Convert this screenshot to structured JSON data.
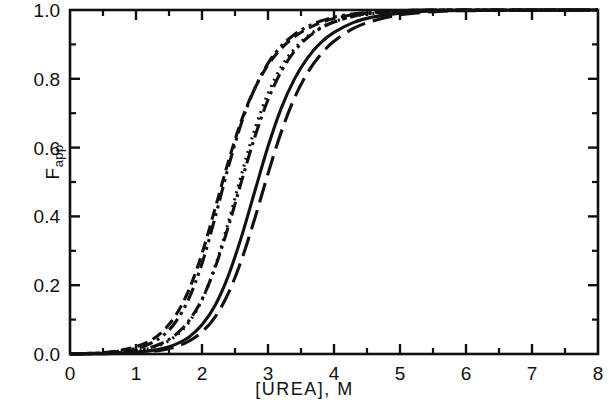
{
  "chart_data": {
    "type": "line",
    "title": "",
    "xlabel": "[UREA], M",
    "ylabel": "Fapp",
    "ylabel_base": "F",
    "ylabel_sub": "app",
    "xlim": [
      0,
      8
    ],
    "ylim": [
      0.0,
      1.0
    ],
    "grid": false,
    "legend": "none",
    "xticks": [
      0,
      1,
      2,
      3,
      4,
      5,
      6,
      7,
      8
    ],
    "xtick_labels": [
      "0",
      "1",
      "2",
      "3",
      "4",
      "5",
      "6",
      "7",
      "8"
    ],
    "xminor_ticks": [
      0.5,
      1.5,
      2.5,
      3.5,
      4.5,
      5.5,
      6.5,
      7.5
    ],
    "yticks": [
      0.0,
      0.2,
      0.4,
      0.6,
      0.8,
      1.0
    ],
    "ytick_labels": [
      "0.0",
      "0.2",
      "0.4",
      "0.6",
      "0.8",
      "1.0"
    ],
    "yminor_ticks": [
      0.1,
      0.3,
      0.5,
      0.7,
      0.9
    ],
    "line_color": "#111111",
    "series": [
      {
        "name": "curve-1",
        "style": "dashed",
        "dasharray": "11,6",
        "midpoint": 1.95,
        "slope": 1.95,
        "x": [
          0.0,
          0.5,
          0.8,
          1.0,
          1.2,
          1.4,
          1.6,
          1.8,
          2.0,
          2.2,
          2.4,
          2.6,
          2.8,
          3.0,
          3.2,
          3.4,
          3.6,
          3.8,
          4.0,
          4.3,
          4.6,
          5.0,
          5.5,
          6.0,
          8.0
        ],
        "y": [
          0.0,
          0.004,
          0.012,
          0.021,
          0.037,
          0.065,
          0.112,
          0.186,
          0.292,
          0.424,
          0.56,
          0.68,
          0.772,
          0.84,
          0.888,
          0.922,
          0.946,
          0.963,
          0.975,
          0.987,
          0.993,
          0.998,
          1.0,
          1.0,
          1.0
        ]
      },
      {
        "name": "curve-2",
        "style": "dash-dot-dot",
        "dasharray": "14,5,3,5,3,5",
        "midpoint": 2.05,
        "slope": 2.1,
        "x": [
          0.0,
          0.5,
          0.8,
          1.0,
          1.2,
          1.4,
          1.6,
          1.8,
          2.0,
          2.2,
          2.4,
          2.6,
          2.8,
          3.0,
          3.2,
          3.4,
          3.6,
          3.8,
          4.0,
          4.3,
          4.6,
          5.0,
          5.5,
          6.0,
          8.0
        ],
        "y": [
          0.0,
          0.003,
          0.009,
          0.016,
          0.029,
          0.052,
          0.093,
          0.161,
          0.263,
          0.398,
          0.544,
          0.673,
          0.772,
          0.845,
          0.895,
          0.929,
          0.952,
          0.968,
          0.979,
          0.989,
          0.994,
          0.998,
          1.0,
          1.0,
          1.0
        ]
      },
      {
        "name": "curve-3",
        "style": "dotted",
        "dasharray": "2,5",
        "midpoint": 2.35,
        "slope": 2.05,
        "x": [
          0.0,
          0.5,
          0.8,
          1.0,
          1.2,
          1.4,
          1.6,
          1.8,
          2.0,
          2.2,
          2.4,
          2.6,
          2.8,
          3.0,
          3.2,
          3.4,
          3.6,
          3.8,
          4.0,
          4.3,
          4.6,
          5.0,
          5.5,
          6.0,
          8.0
        ],
        "y": [
          0.0,
          0.002,
          0.005,
          0.009,
          0.016,
          0.029,
          0.052,
          0.092,
          0.157,
          0.255,
          0.383,
          0.523,
          0.653,
          0.757,
          0.834,
          0.887,
          0.924,
          0.949,
          0.966,
          0.982,
          0.99,
          0.996,
          0.999,
          1.0,
          1.0
        ]
      },
      {
        "name": "curve-4",
        "style": "dash-dot",
        "dasharray": "14,5,3,5",
        "midpoint": 2.45,
        "slope": 1.85,
        "x": [
          0.0,
          0.5,
          0.8,
          1.0,
          1.2,
          1.4,
          1.6,
          1.8,
          2.0,
          2.2,
          2.4,
          2.6,
          2.8,
          3.0,
          3.2,
          3.4,
          3.6,
          3.8,
          4.0,
          4.3,
          4.6,
          5.0,
          5.5,
          6.0,
          8.0
        ],
        "y": [
          0.0,
          0.002,
          0.006,
          0.01,
          0.018,
          0.032,
          0.056,
          0.096,
          0.159,
          0.252,
          0.371,
          0.503,
          0.631,
          0.739,
          0.821,
          0.88,
          0.92,
          0.947,
          0.965,
          0.982,
          0.991,
          0.996,
          0.999,
          1.0,
          1.0
        ]
      },
      {
        "name": "curve-5",
        "style": "solid",
        "dasharray": "none",
        "midpoint": 2.85,
        "slope": 1.75,
        "x": [
          0.0,
          0.5,
          0.8,
          1.0,
          1.2,
          1.4,
          1.6,
          1.8,
          2.0,
          2.2,
          2.4,
          2.6,
          2.8,
          3.0,
          3.2,
          3.4,
          3.6,
          3.8,
          4.0,
          4.3,
          4.6,
          5.0,
          5.5,
          6.0,
          8.0
        ],
        "y": [
          0.0,
          0.001,
          0.003,
          0.005,
          0.009,
          0.016,
          0.028,
          0.049,
          0.085,
          0.142,
          0.228,
          0.342,
          0.473,
          0.603,
          0.714,
          0.799,
          0.861,
          0.905,
          0.935,
          0.964,
          0.98,
          0.991,
          0.997,
          0.999,
          1.0
        ]
      },
      {
        "name": "curve-6",
        "style": "long-dash",
        "dasharray": "20,8",
        "midpoint": 3.05,
        "slope": 1.7,
        "x": [
          0.0,
          0.5,
          0.8,
          1.0,
          1.2,
          1.4,
          1.6,
          1.8,
          2.0,
          2.2,
          2.4,
          2.6,
          2.8,
          3.0,
          3.2,
          3.4,
          3.6,
          3.8,
          4.0,
          4.3,
          4.6,
          5.0,
          5.5,
          6.0,
          8.0
        ],
        "y": [
          0.0,
          0.001,
          0.002,
          0.004,
          0.007,
          0.012,
          0.021,
          0.037,
          0.064,
          0.108,
          0.177,
          0.274,
          0.394,
          0.524,
          0.645,
          0.744,
          0.818,
          0.871,
          0.909,
          0.947,
          0.969,
          0.986,
          0.995,
          0.998,
          1.0
        ]
      }
    ]
  }
}
